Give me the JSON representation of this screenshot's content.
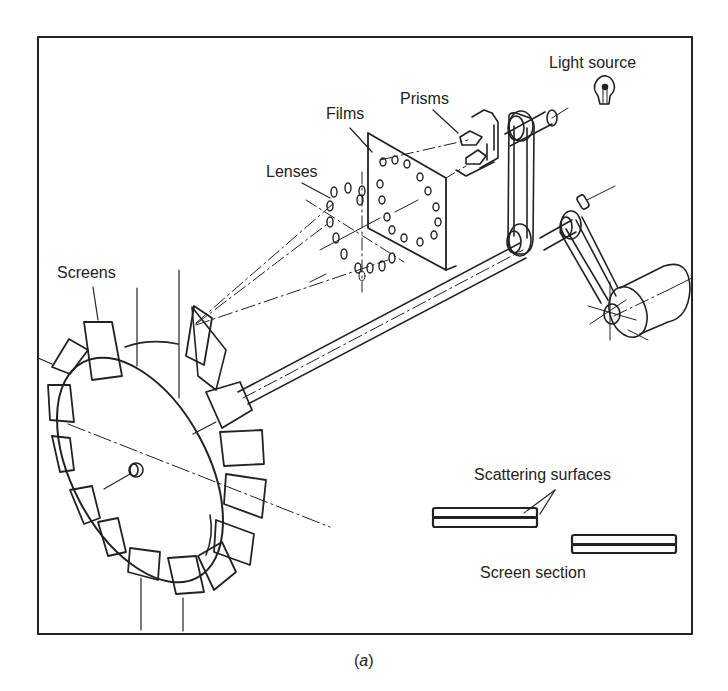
{
  "figure": {
    "caption_open": "(",
    "caption_letter": "a",
    "caption_close": ")",
    "labels": {
      "light_source": "Light source",
      "prisms": "Prisms",
      "films": "Films",
      "lenses": "Lenses",
      "screens": "Screens",
      "scattering_surfaces": "Scattering surfaces",
      "screen_section": "Screen section"
    },
    "colors": {
      "ink": "#222222",
      "background": "#ffffff"
    }
  }
}
